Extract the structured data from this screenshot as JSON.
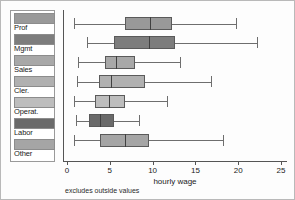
{
  "chart_data": {
    "type": "box",
    "title": "",
    "xlabel": "hourly wage",
    "ylabel": "",
    "xlim": [
      0,
      25
    ],
    "xticks": [
      0,
      5,
      10,
      15,
      20,
      25
    ],
    "grid": false,
    "legend_position": "left",
    "footnote": "excludes outside values",
    "categories": [
      "Prof",
      "Mgmt",
      "Sales",
      "Cler.",
      "Operat.",
      "Labor",
      "Other"
    ],
    "boxes": [
      {
        "label": "Prof",
        "min": 0.8,
        "q1": 6.8,
        "median": 9.7,
        "q3": 12.3,
        "max": 19.7,
        "color": "#999999"
      },
      {
        "label": "Mgmt",
        "min": 2.3,
        "q1": 5.5,
        "median": 9.6,
        "q3": 12.6,
        "max": 22.2,
        "color": "#7d7d7d"
      },
      {
        "label": "Sales",
        "min": 1.3,
        "q1": 4.4,
        "median": 5.7,
        "q3": 7.9,
        "max": 13.2,
        "color": "#a8a8a8"
      },
      {
        "label": "Cler.",
        "min": 1.2,
        "q1": 3.7,
        "median": 5.1,
        "q3": 9.1,
        "max": 16.8,
        "color": "#b0b0b0"
      },
      {
        "label": "Operat.",
        "min": 0.8,
        "q1": 3.3,
        "median": 4.9,
        "q3": 6.8,
        "max": 11.7,
        "color": "#bdbdbd"
      },
      {
        "label": "Labor",
        "min": 1.1,
        "q1": 2.6,
        "median": 3.9,
        "q3": 5.5,
        "max": 8.4,
        "color": "#6a6a6a"
      },
      {
        "label": "Other",
        "min": 0.8,
        "q1": 3.9,
        "median": 6.8,
        "q3": 9.6,
        "max": 18.2,
        "color": "#a5a5a5"
      }
    ]
  },
  "legend": {
    "items": [
      {
        "label": "Prof",
        "color": "#999999"
      },
      {
        "label": "Mgmt",
        "color": "#7d7d7d"
      },
      {
        "label": "Sales",
        "color": "#a8a8a8"
      },
      {
        "label": "Cler.",
        "color": "#b0b0b0"
      },
      {
        "label": "Operat.",
        "color": "#bdbdbd"
      },
      {
        "label": "Labor",
        "color": "#6a6a6a"
      },
      {
        "label": "Other",
        "color": "#a5a5a5"
      }
    ]
  }
}
